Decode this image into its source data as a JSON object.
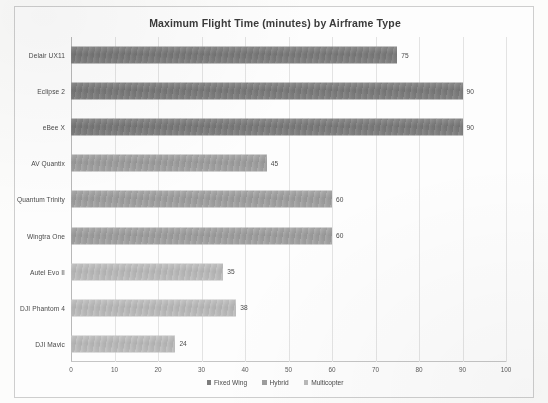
{
  "chart_data": {
    "type": "bar",
    "orientation": "horizontal",
    "title": "Maximum Flight Time (minutes) by Airframe Type",
    "xlabel": "",
    "ylabel": "",
    "xlim": [
      0,
      100
    ],
    "xticks": [
      0,
      10,
      20,
      30,
      40,
      50,
      60,
      70,
      80,
      90,
      100
    ],
    "grid": true,
    "legend_position": "bottom-center",
    "categories": [
      "Delair UX11",
      "Eclipse 2",
      "eBee X",
      "AV Quantix",
      "Quantum Trinity",
      "Wingtra One",
      "Autel Evo II",
      "DJI Phantom 4",
      "DJI Mavic"
    ],
    "values": [
      75,
      90,
      90,
      45,
      60,
      60,
      35,
      38,
      24
    ],
    "point_series": [
      "Fixed Wing",
      "Fixed Wing",
      "Fixed Wing",
      "Hybrid",
      "Hybrid",
      "Hybrid",
      "Multicopter",
      "Multicopter",
      "Multicopter"
    ],
    "bars": [
      {
        "category": "Delair UX11",
        "value": 75,
        "series": "Fixed Wing",
        "label": "75"
      },
      {
        "category": "Eclipse 2",
        "value": 90,
        "series": "Fixed Wing",
        "label": "90"
      },
      {
        "category": "eBee X",
        "value": 90,
        "series": "Fixed Wing",
        "label": "90"
      },
      {
        "category": "AV Quantix",
        "value": 45,
        "series": "Hybrid",
        "label": "45"
      },
      {
        "category": "Quantum Trinity",
        "value": 60,
        "series": "Hybrid",
        "label": "60"
      },
      {
        "category": "Wingtra One",
        "value": 60,
        "series": "Hybrid",
        "label": "60"
      },
      {
        "category": "Autel Evo II",
        "value": 35,
        "series": "Multicopter",
        "label": "35"
      },
      {
        "category": "DJI Phantom 4",
        "value": 38,
        "series": "Multicopter",
        "label": "38"
      },
      {
        "category": "DJI Mavic",
        "value": 24,
        "series": "Multicopter",
        "label": "24"
      }
    ],
    "series": [
      {
        "name": "Fixed Wing",
        "color": "#7d7d7d"
      },
      {
        "name": "Hybrid",
        "color": "#9e9e9e"
      },
      {
        "name": "Multicopter",
        "color": "#bababa"
      }
    ],
    "tick_labels": [
      "0",
      "10",
      "20",
      "30",
      "40",
      "50",
      "60",
      "70",
      "80",
      "90",
      "100"
    ]
  },
  "legend": {
    "items": [
      {
        "label": "Fixed Wing",
        "color": "#7d7d7d"
      },
      {
        "label": "Hybrid",
        "color": "#9e9e9e"
      },
      {
        "label": "Multicopter",
        "color": "#bababa"
      }
    ]
  }
}
